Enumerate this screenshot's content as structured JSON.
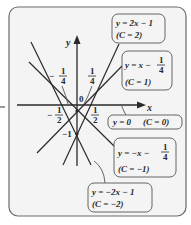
{
  "diagram": {
    "colors": {
      "background": "#ffffff",
      "panel": "#f4f4f4",
      "panel_border": "#6a6a6a",
      "line": "#2a2a2a",
      "label_box": "#f4f4f4",
      "label_border": "#555555"
    },
    "axes": {
      "x_label": "x",
      "y_label": "y",
      "origin_label": "0"
    },
    "ticks": {
      "neg_quarter": {
        "sign": "−",
        "num": "1",
        "den": "4"
      },
      "pos_quarter": {
        "num": "1",
        "den": "4"
      },
      "neg_half": {
        "sign": "−",
        "num": "1",
        "den": "2"
      },
      "pos_half": {
        "num": "1",
        "den": "2"
      },
      "neg_one": "−1"
    },
    "lines": [
      {
        "id": "c2",
        "equation": "y = 2x − 1",
        "eq_y": "y",
        "eq_eq": "=",
        "eq_rhs": "2x − 1",
        "param": "(C = 2)",
        "C": 2
      },
      {
        "id": "c1",
        "equation": "y = x − 1/4",
        "eq_y": "y",
        "eq_rhs_pre": "= x −",
        "frac_num": "1",
        "frac_den": "4",
        "param": "(C = 1)",
        "C": 1
      },
      {
        "id": "c0",
        "equation": "y = 0",
        "eq_text": "y = 0",
        "param": "(C = 0)",
        "C": 0
      },
      {
        "id": "cm1",
        "equation": "y = −x − 1/4",
        "eq_rhs_pre": "y = −x −",
        "frac_num": "1",
        "frac_den": "4",
        "param": "(C = −1)",
        "C": -1
      },
      {
        "id": "cm2",
        "equation": "y = −2x − 1",
        "eq_text": "y = −2x − 1",
        "param": "(C = −2)",
        "C": -2
      }
    ]
  }
}
